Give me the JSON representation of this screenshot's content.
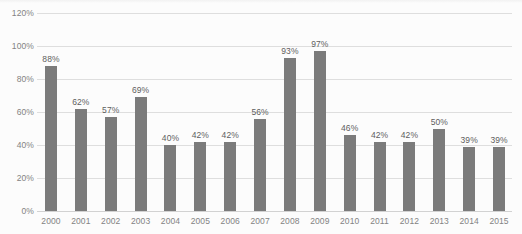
{
  "chart_data": {
    "type": "bar",
    "title": "",
    "subtitle": "",
    "xlabel": "",
    "ylabel": "",
    "categories": [
      "2000",
      "2001",
      "2002",
      "2003",
      "2004",
      "2005",
      "2006",
      "2007",
      "2008",
      "2009",
      "2010",
      "2011",
      "2012",
      "2013",
      "2014",
      "2015"
    ],
    "values": [
      88,
      62,
      57,
      69,
      40,
      42,
      42,
      56,
      93,
      97,
      46,
      42,
      42,
      50,
      39,
      39
    ],
    "value_labels": [
      "88%",
      "62%",
      "57%",
      "69%",
      "40%",
      "42%",
      "42%",
      "56%",
      "93%",
      "97%",
      "46%",
      "42%",
      "42%",
      "50%",
      "39%",
      "39%"
    ],
    "ylim": [
      0,
      120
    ],
    "ytick_values": [
      0,
      20,
      40,
      60,
      80,
      100,
      120
    ],
    "ytick_labels": [
      "0%",
      "20%",
      "40%",
      "60%",
      "80%",
      "100%",
      "120%"
    ],
    "grid": true,
    "legend": "none",
    "series": [
      {
        "name": "",
        "values": [
          88,
          62,
          57,
          69,
          40,
          42,
          42,
          56,
          93,
          97,
          46,
          42,
          42,
          50,
          39,
          39
        ]
      }
    ],
    "colors": {
      "bar": "#7b7b7b",
      "gridline": "#dedede",
      "axis_text": "#838383",
      "label_text": "#5e5e5e",
      "background": "#fcfcfc"
    }
  }
}
